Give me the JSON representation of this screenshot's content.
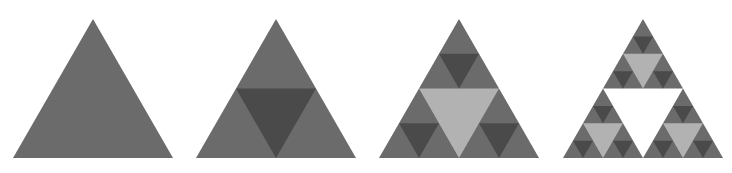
{
  "canvas": {
    "width": 732,
    "height": 173,
    "background": "#ffffff"
  },
  "palette": {
    "base": "#6b6b6b",
    "hole_level_1": "#4a4a4a",
    "hole_level_2": "#b2b2b2",
    "hole_level_3": "#ffffff",
    "background": "#ffffff"
  },
  "figure_set": {
    "title": "Sierpinski triangle iterations",
    "count": 4,
    "shape": "equilateral-triangle",
    "note": "Each successive panel subdivides every filled triangle into three smaller upward triangles, leaving a central inverted triangle; the inverted cut-outs are shaded by their recursion depth."
  },
  "figures": [
    {
      "id": "stage-0",
      "label": "Stage 0",
      "depth": 0,
      "subtriangle_count": 1,
      "hole_count": 0,
      "origin_x": 13,
      "base_y": 158,
      "side": 160,
      "apex_y": 19
    },
    {
      "id": "stage-1",
      "label": "Stage 1",
      "depth": 1,
      "subtriangle_count": 3,
      "hole_count": 1,
      "origin_x": 196,
      "base_y": 158,
      "side": 160,
      "apex_y": 19
    },
    {
      "id": "stage-2",
      "label": "Stage 2",
      "depth": 2,
      "subtriangle_count": 9,
      "hole_count": 4,
      "origin_x": 379,
      "base_y": 158,
      "side": 160,
      "apex_y": 19
    },
    {
      "id": "stage-3",
      "label": "Stage 3",
      "depth": 3,
      "subtriangle_count": 27,
      "hole_count": 13,
      "origin_x": 563,
      "base_y": 158,
      "side": 160,
      "apex_y": 19
    }
  ],
  "chart_data": {
    "type": "diagram",
    "subtitle": "",
    "xlabel": "",
    "ylabel": "",
    "categories": [
      "Stage 0",
      "Stage 1",
      "Stage 2",
      "Stage 3"
    ],
    "series": [
      {
        "name": "Iteration depth",
        "values": [
          0,
          1,
          2,
          3
        ]
      },
      {
        "name": "Filled sub-triangles",
        "values": [
          1,
          3,
          9,
          27
        ]
      },
      {
        "name": "Inverted cut-outs",
        "values": [
          0,
          1,
          4,
          13
        ]
      }
    ],
    "annotations": [],
    "legend": "none",
    "grid": false
  }
}
